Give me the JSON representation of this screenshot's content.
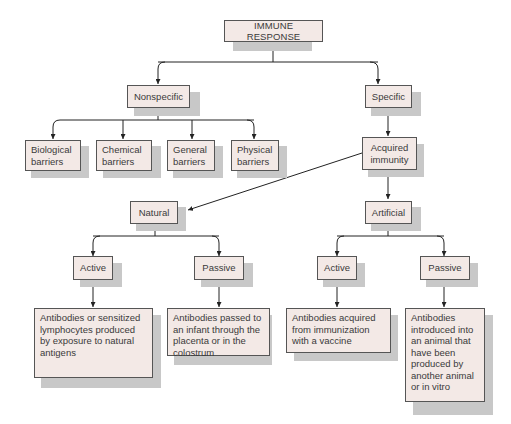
{
  "diagram": {
    "title": "IMMUNE RESPONSE",
    "nodes": {
      "root": "IMMUNE RESPONSE",
      "nonspecific": "Nonspecific",
      "specific": "Specific",
      "biological": "Biological barriers",
      "chemical": "Chemical barriers",
      "general": "General barriers",
      "physical": "Physical barriers",
      "acquired": "Acquired immunity",
      "natural": "Natural",
      "artificial": "Artificial",
      "natural_active": "Active",
      "natural_passive": "Passive",
      "artificial_active": "Active",
      "artificial_passive": "Passive",
      "natural_active_desc": "Antibodies or sensitized lymphocytes produced by exposure to natural antigens",
      "natural_passive_desc": "Antibodies passed to an infant through the placenta or in the colostrum",
      "artificial_active_desc": "Antibodies acquired from immunization with a vaccine",
      "artificial_passive_desc": "Antibodies introduced into an animal that have been produced by another animal or in vitro"
    },
    "edges": [
      [
        "root",
        "nonspecific"
      ],
      [
        "root",
        "specific"
      ],
      [
        "nonspecific",
        "biological"
      ],
      [
        "nonspecific",
        "chemical"
      ],
      [
        "nonspecific",
        "general"
      ],
      [
        "nonspecific",
        "physical"
      ],
      [
        "specific",
        "acquired"
      ],
      [
        "acquired",
        "natural"
      ],
      [
        "acquired",
        "artificial"
      ],
      [
        "natural",
        "natural_active"
      ],
      [
        "natural",
        "natural_passive"
      ],
      [
        "artificial",
        "artificial_active"
      ],
      [
        "artificial",
        "artificial_passive"
      ],
      [
        "natural_active",
        "natural_active_desc"
      ],
      [
        "natural_passive",
        "natural_passive_desc"
      ],
      [
        "artificial_active",
        "artificial_active_desc"
      ],
      [
        "artificial_passive",
        "artificial_passive_desc"
      ]
    ],
    "colors": {
      "box_fill": "#f3e9e6",
      "box_border": "#555555",
      "shadow": "#c8c8c8",
      "line": "#222222"
    }
  }
}
